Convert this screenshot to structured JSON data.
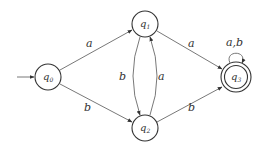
{
  "diagram": {
    "type": "finite-automaton",
    "start_state": "q0",
    "states": [
      {
        "id": "q0",
        "name": "q",
        "sub": "0",
        "accepting": false
      },
      {
        "id": "q1",
        "name": "q",
        "sub": "1",
        "accepting": false
      },
      {
        "id": "q2",
        "name": "q",
        "sub": "2",
        "accepting": false
      },
      {
        "id": "q3",
        "name": "q",
        "sub": "3",
        "accepting": true
      }
    ],
    "transitions": [
      {
        "from": "q0",
        "to": "q1",
        "label": "a"
      },
      {
        "from": "q0",
        "to": "q2",
        "label": "b"
      },
      {
        "from": "q1",
        "to": "q2",
        "label": "b"
      },
      {
        "from": "q2",
        "to": "q1",
        "label": "a"
      },
      {
        "from": "q1",
        "to": "q3",
        "label": "a"
      },
      {
        "from": "q2",
        "to": "q3",
        "label": "b"
      },
      {
        "from": "q3",
        "to": "q3",
        "label": "a,b"
      }
    ]
  },
  "colors": {
    "stroke": "#333333",
    "edge": "#555555",
    "background": "#ffffff"
  }
}
